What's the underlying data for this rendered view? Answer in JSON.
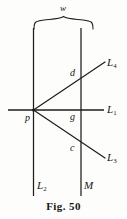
{
  "figure": {
    "caption": "Fig. 50",
    "width_label": "w",
    "source_point": "p",
    "intersections": {
      "upper": "d",
      "middle": "g",
      "lower": "c"
    },
    "rays": [
      {
        "name": "L",
        "subscript": "4",
        "position": "upper-right"
      },
      {
        "name": "L",
        "subscript": "1",
        "position": "middle-right"
      },
      {
        "name": "L",
        "subscript": "3",
        "position": "lower-right"
      }
    ],
    "vertical_lines": [
      {
        "name": "L",
        "subscript": "2",
        "position": "bottom-left"
      },
      {
        "name": "M",
        "subscript": "",
        "position": "bottom-right"
      }
    ],
    "colors": {
      "ink": "#161616",
      "paper": "#fdfdfb"
    }
  }
}
